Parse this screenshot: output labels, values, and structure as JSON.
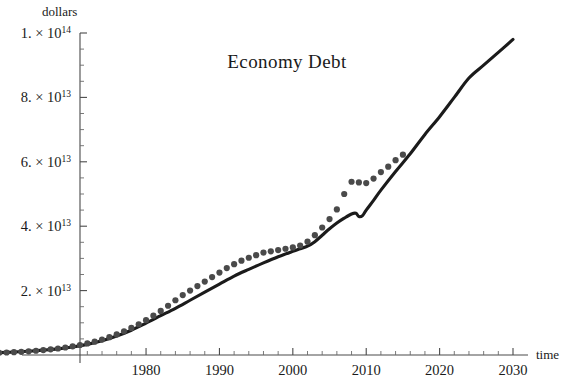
{
  "chart_data": {
    "type": "line",
    "title": "Economy  Debt",
    "xlabel": "time",
    "ylabel": "dollars",
    "xlim": [
      1950,
      2032
    ],
    "ylim": [
      0,
      105000000000000
    ],
    "grid": false,
    "legend": "none",
    "x_ticks": [
      1980,
      1990,
      2000,
      2010,
      2020,
      2030
    ],
    "x_tick_labels": [
      "1980",
      "1990",
      "2000",
      "2010",
      "2020",
      "2030"
    ],
    "x_minor_step": 2,
    "y_ticks": [
      20000000000000,
      40000000000000,
      60000000000000,
      80000000000000,
      100000000000000
    ],
    "y_tick_labels": [
      "2.×10",
      "4.×10",
      "6.×10",
      "8.×10",
      "1.×10"
    ],
    "y_tick_label_mantissas": [
      "2.",
      "4.",
      "6.",
      "8.",
      "1."
    ],
    "y_tick_label_exponents": [
      "13",
      "13",
      "13",
      "13",
      "14"
    ],
    "y_minor_step": 5000000000000,
    "series": [
      {
        "name": "model-curve",
        "style": "solid-line",
        "color": "#1b1b1b",
        "x": [
          1950,
          1952,
          1954,
          1956,
          1958,
          1960,
          1962,
          1964,
          1966,
          1968,
          1970,
          1972,
          1974,
          1976,
          1978,
          1980,
          1982,
          1984,
          1986,
          1988,
          1990,
          1992,
          1994,
          1996,
          1998,
          2000,
          2001,
          2002,
          2003,
          2004,
          2005,
          2006,
          2007,
          2008,
          2008.6,
          2009,
          2009.5,
          2010,
          2011,
          2012,
          2014,
          2016,
          2018,
          2020,
          2022,
          2024,
          2026,
          2028,
          2030
        ],
        "y": [
          200000000000.0,
          260000000000.0,
          340000000000.0,
          440000000000.0,
          560000000000.0,
          720000000000.0,
          920000000000.0,
          1180000000000.0,
          1500000000000.0,
          1900000000000.0,
          2500000000000.0,
          3300000000000.0,
          4400000000000.0,
          5900000000000.0,
          7700000000000.0,
          9900000000000.0,
          12200000000000.0,
          14500000000000.0,
          17000000000000.0,
          19500000000000.0,
          22000000000000.0,
          24500000000000.0,
          26600000000000.0,
          28600000000000.0,
          30500000000000.0,
          32200000000000.0,
          33000000000000.0,
          33800000000000.0,
          35200000000000.0,
          37200000000000.0,
          39200000000000.0,
          41000000000000.0,
          42500000000000.0,
          43800000000000.0,
          44000000000000.0,
          43000000000000.0,
          43300000000000.0,
          45000000000000.0,
          48000000000000.0,
          51200000000000.0,
          57000000000000.0,
          62500000000000.0,
          68500000000000.0,
          74000000000000.0,
          80000000000000.0,
          86000000000000.0,
          90000000000000.0,
          94000000000000.0,
          98000000000000.0
        ]
      },
      {
        "name": "actual-data-points",
        "style": "dots",
        "color": "#4a4a4a",
        "x": [
          1950,
          1951,
          1952,
          1953,
          1954,
          1955,
          1956,
          1957,
          1958,
          1959,
          1960,
          1961,
          1962,
          1963,
          1964,
          1965,
          1966,
          1967,
          1968,
          1969,
          1970,
          1971,
          1972,
          1973,
          1974,
          1975,
          1976,
          1977,
          1978,
          1979,
          1980,
          1981,
          1982,
          1983,
          1984,
          1985,
          1986,
          1987,
          1988,
          1989,
          1990,
          1991,
          1992,
          1993,
          1994,
          1995,
          1996,
          1997,
          1998,
          1999,
          2000,
          2001,
          2002,
          2003,
          2004,
          2005,
          2006,
          2007,
          2008,
          2009,
          2010,
          2011,
          2012,
          2013,
          2014,
          2015
        ],
        "y": [
          200000000000.0,
          220000000000.0,
          250000000000.0,
          280000000000.0,
          320000000000.0,
          360000000000.0,
          410000000000.0,
          460000000000.0,
          520000000000.0,
          600000000000.0,
          680000000000.0,
          770000000000.0,
          880000000000.0,
          1000000000000.0,
          1150000000000.0,
          1320000000000.0,
          1520000000000.0,
          1750000000000.0,
          2020000000000.0,
          2330000000000.0,
          2700000000000.0,
          3100000000000.0,
          3600000000000.0,
          4150000000000.0,
          4800000000000.0,
          5550000000000.0,
          6400000000000.0,
          7350000000000.0,
          8400000000000.0,
          9550000000000.0,
          10800000000000.0,
          12200000000000.0,
          13700000000000.0,
          15300000000000.0,
          17000000000000.0,
          18600000000000.0,
          20000000000000.0,
          21400000000000.0,
          22800000000000.0,
          24200000000000.0,
          25600000000000.0,
          27000000000000.0,
          28200000000000.0,
          29300000000000.0,
          30200000000000.0,
          31000000000000.0,
          31800000000000.0,
          32200000000000.0,
          32600000000000.0,
          33000000000000.0,
          33400000000000.0,
          34000000000000.0,
          35200000000000.0,
          37200000000000.0,
          39600000000000.0,
          42200000000000.0,
          45200000000000.0,
          50000000000000.0,
          53800000000000.0,
          53600000000000.0,
          53400000000000.0,
          54800000000000.0,
          56800000000000.0,
          58500000000000.0,
          60500000000000.0,
          62200000000000.0
        ]
      }
    ]
  },
  "axes": {
    "y_axis_name": "dollars",
    "x_axis_name": "time"
  }
}
